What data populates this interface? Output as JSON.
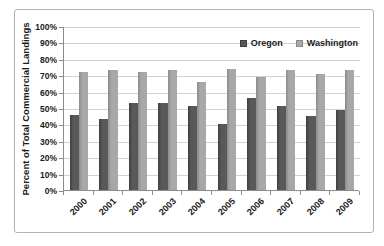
{
  "chart_data": {
    "type": "bar",
    "title": "",
    "xlabel": "",
    "ylabel": "Percent of Total Commercial Landings",
    "ylim": [
      0,
      100
    ],
    "ytick_step": 10,
    "ytick_labels": [
      "0%",
      "10%",
      "20%",
      "30%",
      "40%",
      "50%",
      "60%",
      "70%",
      "80%",
      "90%",
      "100%"
    ],
    "grid": true,
    "legend_position": "top-right-inside",
    "categories": [
      "2000",
      "2001",
      "2002",
      "2003",
      "2004",
      "2005",
      "2006",
      "2007",
      "2008",
      "2009"
    ],
    "series": [
      {
        "name": "Oregon",
        "color": "#595959",
        "edge_color": "#3f3f3f",
        "values": [
          46,
          43,
          53,
          53,
          51,
          40,
          56,
          51,
          45,
          49
        ]
      },
      {
        "name": "Washington",
        "color": "#a8a8a8",
        "edge_color": "#8a8a8a",
        "values": [
          72,
          73,
          72,
          73,
          66,
          74,
          69,
          73,
          71,
          73
        ]
      }
    ]
  },
  "colors": {
    "frame_border": "#b3b3b3",
    "axis_line": "#8c8c8c",
    "gridline": "#d2d2d2",
    "text": "#1a1a1a",
    "background": "#ffffff"
  }
}
